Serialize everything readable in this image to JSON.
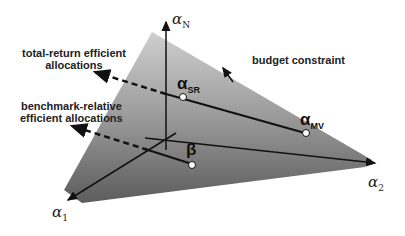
{
  "labels": {
    "total_return_line1": "total-return efficient",
    "total_return_line2": "allocations",
    "benchmark_line1": "benchmark-relative",
    "benchmark_line2": "efficient allocations",
    "budget": "budget constraint"
  },
  "axes": {
    "vertical": {
      "symbol": "α",
      "sub": "N"
    },
    "left": {
      "symbol": "α",
      "sub": "1"
    },
    "right": {
      "symbol": "α",
      "sub": "2"
    }
  },
  "points": {
    "sr": {
      "symbol": "α",
      "sub": "SR"
    },
    "mv": {
      "symbol": "α",
      "sub": "MV"
    },
    "beta": {
      "symbol": "β"
    }
  },
  "colors": {
    "plane_top": "#c8c8c8",
    "plane_bottom": "#5a5a5a",
    "line": "#111111"
  }
}
